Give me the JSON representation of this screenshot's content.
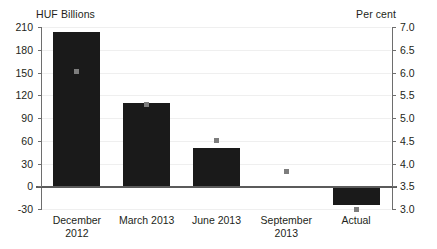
{
  "chart_data": {
    "type": "bar",
    "title": "",
    "subtitle": "",
    "categories": [
      "December 2012",
      "March 2013",
      "June 2013",
      "September 2013",
      "Actual"
    ],
    "category_lines": [
      [
        "December",
        "2012"
      ],
      [
        "March 2013",
        ""
      ],
      [
        "June 2013",
        ""
      ],
      [
        "September",
        "2013"
      ],
      [
        "Actual",
        ""
      ]
    ],
    "series": [
      {
        "name": "HUF Billions",
        "type": "bar",
        "axis": "left",
        "values": [
          203,
          110,
          50,
          0,
          -25
        ]
      },
      {
        "name": "Per cent",
        "type": "scatter",
        "axis": "right",
        "values": [
          6.03,
          5.3,
          4.5,
          3.83,
          3.0
        ]
      }
    ],
    "xlabel": "",
    "ylabel": "HUF Billions",
    "y2label": "Per cent",
    "ylim": [
      -30,
      210
    ],
    "y2lim": [
      3.0,
      7.0
    ],
    "yticks": [
      210,
      180,
      150,
      120,
      90,
      60,
      30,
      0,
      -30
    ],
    "y2ticks": [
      "7.0",
      "6.5",
      "6.0",
      "5.5",
      "5.0",
      "4.5",
      "4.0",
      "3.5",
      "3.0"
    ],
    "grid": true,
    "legend": "none",
    "bar_color": "#1a1a1a",
    "marker_color": "#7d7d7d",
    "zero_line_color": "#5b5b5b"
  },
  "axes": {
    "left_unit": "HUF Billions",
    "right_unit": "Per cent"
  },
  "footnote": ""
}
